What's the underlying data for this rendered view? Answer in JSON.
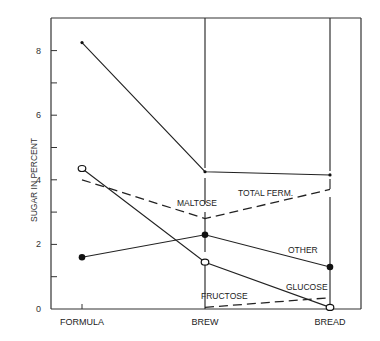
{
  "chart_data": {
    "type": "line",
    "title": "",
    "xlabel": "",
    "ylabel": "SUGAR IN PERCENT",
    "ylim": [
      0,
      9
    ],
    "yticks": [
      0,
      2,
      4,
      6,
      8
    ],
    "ytick_labels": [
      "0",
      "2",
      "4",
      "6",
      "8"
    ],
    "grid": false,
    "legend": "inline labels",
    "categories": [
      "FORMULA",
      "BREW",
      "BREAD"
    ],
    "series": [
      {
        "name": "TOTAL FERM.",
        "style": "solid",
        "marker": "dot",
        "values": [
          8.25,
          4.25,
          4.15
        ]
      },
      {
        "name": "MALTOSE",
        "style": "dashed",
        "marker": "none",
        "values": [
          4.0,
          2.8,
          3.7
        ]
      },
      {
        "name": "OTHER",
        "style": "solid",
        "marker": "filled-circle",
        "values": [
          1.6,
          2.3,
          1.3
        ]
      },
      {
        "name": "GLUCOSE",
        "style": "solid",
        "marker": "open-circle",
        "values": [
          4.35,
          1.45,
          0.05
        ]
      },
      {
        "name": "FRUCTOSE",
        "style": "dashed",
        "marker": "none",
        "values": [
          null,
          0.05,
          0.35
        ]
      }
    ]
  }
}
